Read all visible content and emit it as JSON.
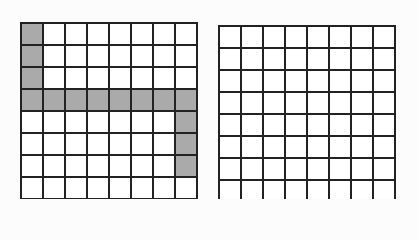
{
  "canvas": {
    "width": 418,
    "height": 199,
    "background_color": "#fcfcfc"
  },
  "figure": {
    "grid_line_color": "#222222",
    "cell_fill_color": "#ffffff",
    "shaded_fill_color": "#aaaaaa",
    "cell_size_px": 22,
    "line_width_px": 2
  },
  "grids": [
    {
      "name": "left-grid",
      "rows": 8,
      "cols": 8,
      "origin_x": 20,
      "origin_y": 22,
      "shaded_cells": [
        [
          1,
          1
        ],
        [
          2,
          1
        ],
        [
          3,
          1
        ],
        [
          4,
          1
        ],
        [
          4,
          2
        ],
        [
          4,
          3
        ],
        [
          4,
          4
        ],
        [
          4,
          5
        ],
        [
          4,
          6
        ],
        [
          4,
          7
        ],
        [
          4,
          8
        ],
        [
          5,
          8
        ],
        [
          6,
          8
        ],
        [
          7,
          8
        ]
      ],
      "shaded_count": 14,
      "shape_map": [
        [
          "shaded",
          "empty",
          "empty",
          "empty",
          "empty",
          "empty",
          "empty",
          "empty"
        ],
        [
          "shaded",
          "empty",
          "empty",
          "empty",
          "empty",
          "empty",
          "empty",
          "empty"
        ],
        [
          "shaded",
          "empty",
          "empty",
          "empty",
          "empty",
          "empty",
          "empty",
          "empty"
        ],
        [
          "shaded",
          "shaded",
          "shaded",
          "shaded",
          "shaded",
          "shaded",
          "shaded",
          "shaded"
        ],
        [
          "empty",
          "empty",
          "empty",
          "empty",
          "empty",
          "empty",
          "empty",
          "shaded"
        ],
        [
          "empty",
          "empty",
          "empty",
          "empty",
          "empty",
          "empty",
          "empty",
          "shaded"
        ],
        [
          "empty",
          "empty",
          "empty",
          "empty",
          "empty",
          "empty",
          "empty",
          "shaded"
        ],
        [
          "empty",
          "empty",
          "empty",
          "empty",
          "empty",
          "empty",
          "empty",
          "empty"
        ]
      ]
    },
    {
      "name": "right-grid",
      "rows": 8,
      "cols": 8,
      "origin_x": 218,
      "origin_y": 25,
      "shaded_cells": [],
      "shaded_count": 0,
      "shape_map": [
        [
          "empty",
          "empty",
          "empty",
          "empty",
          "empty",
          "empty",
          "empty",
          "empty"
        ],
        [
          "empty",
          "empty",
          "empty",
          "empty",
          "empty",
          "empty",
          "empty",
          "empty"
        ],
        [
          "empty",
          "empty",
          "empty",
          "empty",
          "empty",
          "empty",
          "empty",
          "empty"
        ],
        [
          "empty",
          "empty",
          "empty",
          "empty",
          "empty",
          "empty",
          "empty",
          "empty"
        ],
        [
          "empty",
          "empty",
          "empty",
          "empty",
          "empty",
          "empty",
          "empty",
          "empty"
        ],
        [
          "empty",
          "empty",
          "empty",
          "empty",
          "empty",
          "empty",
          "empty",
          "empty"
        ],
        [
          "empty",
          "empty",
          "empty",
          "empty",
          "empty",
          "empty",
          "empty",
          "empty"
        ],
        [
          "empty",
          "empty",
          "empty",
          "empty",
          "empty",
          "empty",
          "empty",
          "empty"
        ]
      ]
    }
  ]
}
